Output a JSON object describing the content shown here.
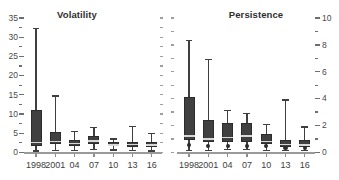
{
  "figure": {
    "background": "#ffffff",
    "box_fill": "#404040",
    "median_color": "#d8d8d8",
    "axis_color": "#9a9a9a"
  },
  "panels": {
    "left": {
      "title": "Volatility"
    },
    "right": {
      "title": "Persistence"
    }
  },
  "axes": {
    "left": {
      "major_labels": [
        "0",
        "5",
        "10",
        "15",
        "20",
        "25",
        "30",
        "35"
      ],
      "major_values": [
        0,
        5,
        10,
        15,
        20,
        25,
        30,
        35
      ],
      "minor_values": [
        2.5,
        7.5,
        12.5,
        17.5,
        22.5,
        27.5,
        32.5
      ],
      "range": [
        0,
        35
      ]
    },
    "right": {
      "major_labels": [
        "0",
        "2",
        "4",
        "6",
        "8",
        "10"
      ],
      "major_values": [
        0,
        2,
        4,
        6,
        8,
        10
      ],
      "minor_values": [
        1,
        3,
        5,
        7,
        9
      ],
      "range": [
        0,
        10
      ]
    },
    "x_labels": [
      "1998",
      "2001",
      "04",
      "07",
      "10",
      "13",
      "16"
    ]
  },
  "chart_data": [
    {
      "type": "box",
      "title": "Volatility",
      "xlabel": "",
      "ylabel": "",
      "categories": [
        "1998",
        "2001",
        "04",
        "07",
        "10",
        "13",
        "16"
      ],
      "ylim": [
        0,
        35
      ],
      "yticks": [
        0,
        5,
        10,
        15,
        20,
        25,
        30,
        35
      ],
      "grid": false,
      "legend": "none",
      "boxes": [
        {
          "category": "1998",
          "whisker_low": 0.4,
          "q1": 1.7,
          "median": 2.6,
          "q3": 11.0,
          "whisker_high": 32.2
        },
        {
          "category": "2001",
          "whisker_low": 0.5,
          "q1": 2.3,
          "median": 2.8,
          "q3": 5.2,
          "whisker_high": 14.7
        },
        {
          "category": "04",
          "whisker_low": 0.5,
          "q1": 1.6,
          "median": 2.3,
          "q3": 3.3,
          "whisker_high": 5.4
        },
        {
          "category": "07",
          "whisker_low": 0.7,
          "q1": 2.3,
          "median": 2.9,
          "q3": 4.4,
          "whisker_high": 6.4
        },
        {
          "category": "10",
          "whisker_low": 0.6,
          "q1": 1.6,
          "median": 2.0,
          "q3": 2.8,
          "whisker_high": 3.5
        },
        {
          "category": "13",
          "whisker_low": 0.5,
          "q1": 1.5,
          "median": 2.1,
          "q3": 2.7,
          "whisker_high": 6.8
        },
        {
          "category": "16",
          "whisker_low": 0.4,
          "q1": 1.4,
          "median": 1.9,
          "q3": 2.6,
          "whisker_high": 5.0
        }
      ]
    },
    {
      "type": "box",
      "title": "Persistence",
      "xlabel": "",
      "ylabel": "",
      "categories": [
        "1998",
        "2001",
        "04",
        "07",
        "10",
        "13",
        "16"
      ],
      "ylim": [
        0,
        10
      ],
      "yticks": [
        0,
        2,
        4,
        6,
        8,
        10
      ],
      "grid": false,
      "legend": "none",
      "boxes": [
        {
          "category": "1998",
          "whisker_low": 0.15,
          "q1": 0.9,
          "median": 1.2,
          "q3": 4.1,
          "whisker_high": 8.3,
          "outlier": 0.55
        },
        {
          "category": "2001",
          "whisker_low": 0.15,
          "q1": 0.8,
          "median": 1.0,
          "q3": 2.4,
          "whisker_high": 6.9,
          "outlier": 0.5
        },
        {
          "category": "04",
          "whisker_low": 0.2,
          "q1": 0.8,
          "median": 1.1,
          "q3": 2.2,
          "whisker_high": 3.1,
          "outlier": 0.5
        },
        {
          "category": "07",
          "whisker_low": 0.2,
          "q1": 0.8,
          "median": 1.2,
          "q3": 2.2,
          "whisker_high": 2.9,
          "outlier": 0.5
        },
        {
          "category": "10",
          "whisker_low": 0.15,
          "q1": 0.6,
          "median": 0.8,
          "q3": 1.4,
          "whisker_high": 2.1,
          "outlier": 0.45
        },
        {
          "category": "13",
          "whisker_low": 0.15,
          "q1": 0.4,
          "median": 0.6,
          "q3": 0.95,
          "whisker_high": 3.9,
          "outlier": 0.35
        },
        {
          "category": "16",
          "whisker_low": 0.15,
          "q1": 0.4,
          "median": 0.55,
          "q3": 0.9,
          "whisker_high": 1.9,
          "outlier": 0.35
        }
      ]
    }
  ]
}
